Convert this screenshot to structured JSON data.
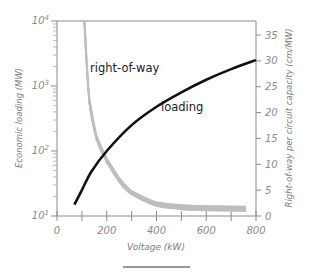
{
  "chart_data": {
    "type": "line",
    "title": "",
    "xlabel": "Voltage (kW)",
    "ylabel_left": "Economic loading (MW)",
    "ylabel_right": "Right-of-way per circuit capacity (cm/MW)",
    "xlim": [
      0,
      800
    ],
    "ylim_left": [
      10,
      10000
    ],
    "ylim_left_scale": "log",
    "ylim_right": [
      0,
      35
    ],
    "x_ticks": [
      0,
      100,
      200,
      300,
      400,
      500,
      600,
      700,
      800
    ],
    "x_tick_labels": [
      "0",
      "200",
      "400",
      "600",
      "800"
    ],
    "y_left_tick_labels": [
      "10^1",
      "10^2",
      "10^3",
      "10^4"
    ],
    "y_right_ticks": [
      0,
      5,
      10,
      15,
      20,
      25,
      30,
      35
    ],
    "grid": false,
    "legend": "inline labels",
    "series": [
      {
        "name": "loading",
        "axis": "left",
        "color": "#111111",
        "x": [
          70,
          100,
          138,
          200,
          300,
          400,
          500,
          600,
          700,
          800
        ],
        "values": [
          15,
          25,
          48,
          100,
          250,
          480,
          800,
          1250,
          1820,
          2500
        ]
      },
      {
        "name": "right-of-way",
        "axis": "right",
        "color": "#b8b8b8",
        "x": [
          110,
          130,
          160,
          200,
          250,
          300,
          400,
          500,
          600,
          760
        ],
        "values": [
          37.7,
          22.4,
          15.0,
          10.8,
          7.0,
          4.5,
          2.3,
          1.7,
          1.5,
          1.4
        ]
      }
    ],
    "annotations": [
      {
        "text": "right-of-way",
        "near_series": "right-of-way"
      },
      {
        "text": "loading",
        "near_series": "loading"
      }
    ]
  },
  "labels": {
    "x_axis_title": "Voltage (kW)",
    "y_left_title": "Economic loading (MW)",
    "y_right_title": "Right-of-way per circuit capacity (cm/MW)",
    "series_rightofway": "right-of-way",
    "series_loading": "loading",
    "x_ticks": [
      "0",
      "200",
      "400",
      "600",
      "800"
    ],
    "y_left_base": "10",
    "y_left_exps": [
      "1",
      "2",
      "3",
      "4"
    ],
    "y_right_ticks": [
      "0",
      "5",
      "10",
      "15",
      "20",
      "25",
      "30",
      "35"
    ]
  }
}
